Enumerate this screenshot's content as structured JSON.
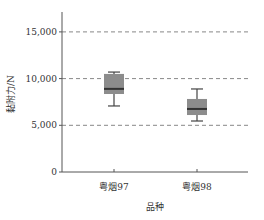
{
  "chart_data": {
    "type": "boxplot",
    "title": "",
    "xlabel": "品种",
    "ylabel": "黏附力/N",
    "ylim": [
      0,
      17500
    ],
    "yticks": [
      0,
      5000,
      10000,
      15000
    ],
    "ytick_labels": [
      "0",
      "5,000",
      "10,000",
      "15,000"
    ],
    "grid": "horizontal dashed at 5,000, 10,000, 15,000",
    "categories": [
      "粤烟97",
      "粤烟98"
    ],
    "series": [
      {
        "name": "粤烟97",
        "whisker_low": 7070,
        "q1": 8350,
        "median": 8900,
        "q3": 10500,
        "whisker_high": 10700
      },
      {
        "name": "粤烟98",
        "whisker_low": 5460,
        "q1": 6100,
        "median": 6750,
        "q3": 7820,
        "whisker_high": 8890
      }
    ],
    "colors": {
      "box_fill": "#8c8c8c",
      "median_line": "#333333",
      "whisker": "#444444",
      "grid": "#888888",
      "axis": "#555555"
    }
  }
}
